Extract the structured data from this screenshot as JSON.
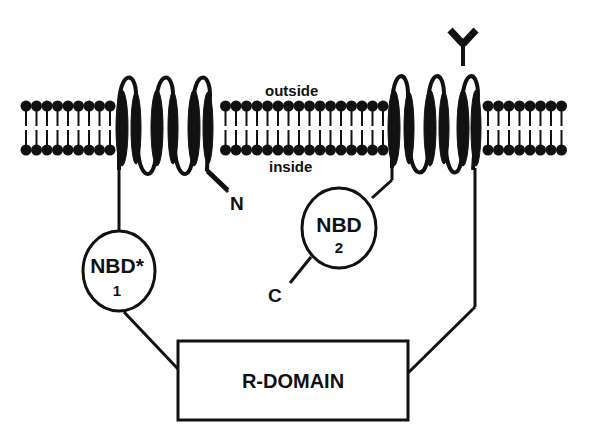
{
  "diagram": {
    "type": "membrane-protein-topology",
    "labels": {
      "outside": "outside",
      "inside": "inside",
      "n_terminus": "N",
      "c_terminus": "C",
      "nbd1_title": "NBD*",
      "nbd1_number": "1",
      "nbd2_title": "NBD",
      "nbd2_number": "2",
      "r_domain": "R-DOMAIN"
    },
    "membrane": {
      "x_start": 22,
      "x_end": 568,
      "outer_head_y": 106,
      "inner_head_y": 150
    },
    "transmembrane_groups": [
      {
        "name": "tm-group-1",
        "helices": 6
      },
      {
        "name": "tm-group-2",
        "helices": 6,
        "glycosylation": true
      }
    ],
    "colors": {
      "ink": "#111111",
      "background": "#ffffff"
    }
  }
}
